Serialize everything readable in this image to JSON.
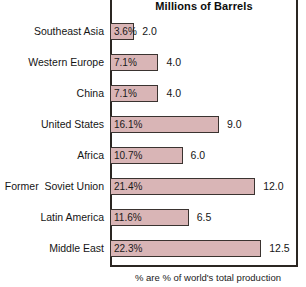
{
  "chart_data": {
    "type": "bar",
    "orientation": "horizontal",
    "title": "Millions of Barrels",
    "xlabel": "",
    "ylabel": "",
    "footnote": "% are % of world's total production",
    "xlim": [
      0,
      15.5
    ],
    "grid": false,
    "legend": null,
    "bar_color": "#d9b5b6",
    "bar_border_color": "#3a3330",
    "categories": [
      "Southeast Asia",
      "Western Europe",
      "China",
      "United States",
      "Africa",
      "Former  Soviet Union",
      "Latin America",
      "Middle East"
    ],
    "values": [
      2.0,
      4.0,
      4.0,
      9.0,
      6.0,
      12.0,
      6.5,
      12.5
    ],
    "value_labels": [
      "2.0",
      "4.0",
      "4.0",
      "9.0",
      "6.0",
      "12.0",
      "6.5",
      "12.5"
    ],
    "percent_labels": [
      "3.6%",
      "7.1%",
      "7.1%",
      "16.1%",
      "10.7%",
      "21.4%",
      "11.6%",
      "22.3%"
    ],
    "percents": [
      3.6,
      7.1,
      7.1,
      16.1,
      10.7,
      21.4,
      11.6,
      22.3
    ]
  }
}
